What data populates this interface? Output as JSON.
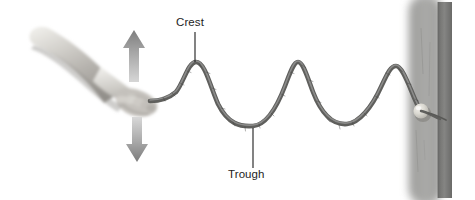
{
  "figure": {
    "background_color": "#ffffff",
    "width": 475,
    "height": 200
  },
  "labels": {
    "crest": {
      "text": "Crest",
      "color": "#1d1d1d",
      "leader_line": {
        "x": 195,
        "y_start": 32,
        "y_end": 62
      }
    },
    "trough": {
      "text": "Trough",
      "color": "#1d1d1d",
      "leader_line": {
        "x": 253,
        "y_start": 128,
        "y_end": 168
      }
    }
  },
  "arrows": {
    "up": {
      "name": "up-arrow",
      "direction": "up",
      "color": "#9a9a9a",
      "x_center": 134,
      "y_top": 30,
      "y_bottom": 82
    },
    "down": {
      "name": "down-arrow",
      "direction": "down",
      "color": "#9a9a9a",
      "x_center": 137,
      "y_top": 117,
      "y_bottom": 162
    }
  },
  "rope": {
    "name": "rope-wave",
    "color": "#6d6d6d",
    "highlight_color": "#a8a8a8",
    "stroke_width": 4.2,
    "start": {
      "x": 150,
      "y": 100
    },
    "end": {
      "x": 420,
      "y": 110
    },
    "crests": [
      {
        "x": 195,
        "y": 62
      },
      {
        "x": 297,
        "y": 62
      },
      {
        "x": 395,
        "y": 66
      }
    ],
    "troughs": [
      {
        "x": 253,
        "y": 126
      },
      {
        "x": 348,
        "y": 124
      }
    ]
  },
  "arm": {
    "name": "arm-photo",
    "description": "grayscale photograph of a forearm and hand gripping the rope",
    "skin_light": "#e8e6e3",
    "skin_mid": "#c9c6c2",
    "skin_shadow": "#9d9a96"
  },
  "post": {
    "name": "door-post",
    "face_color": "#a3a3a1",
    "edge_color": "#7c7c7a",
    "x": 408,
    "width": 46,
    "knob": {
      "name": "doorknob",
      "color": "#dcdad4",
      "x": 421,
      "y": 111,
      "radius": 7.5
    }
  }
}
